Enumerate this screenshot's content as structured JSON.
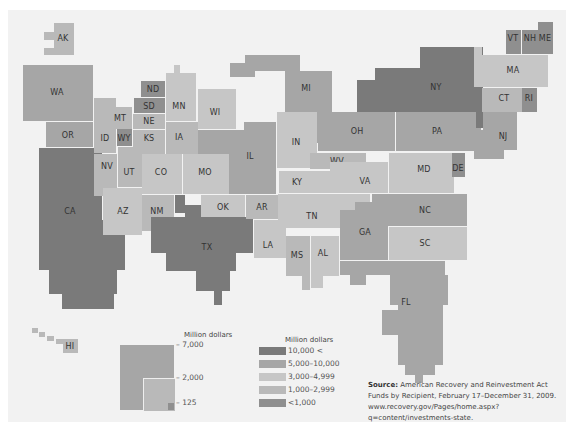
{
  "map": {
    "type": "cartogram",
    "subject": "American Recovery and Reinvestment Act funds by state recipient",
    "states": [
      {
        "code": "AK",
        "category": "1,000-2,999"
      },
      {
        "code": "HI",
        "category": "1,000-2,999"
      },
      {
        "code": "WA",
        "category": "5,000-10,000"
      },
      {
        "code": "OR",
        "category": "5,000-10,000"
      },
      {
        "code": "CA",
        "category": "10,000 <"
      },
      {
        "code": "ID",
        "category": "1,000-2,999"
      },
      {
        "code": "NV",
        "category": "1,000-2,999"
      },
      {
        "code": "MT",
        "category": "1,000-2,999"
      },
      {
        "code": "WY",
        "category": "<1,000"
      },
      {
        "code": "UT",
        "category": "1,000-2,999"
      },
      {
        "code": "AZ",
        "category": "3,000-4,999"
      },
      {
        "code": "CO",
        "category": "3,000-4,999"
      },
      {
        "code": "NM",
        "category": "1,000-2,999"
      },
      {
        "code": "ND",
        "category": "<1,000"
      },
      {
        "code": "SD",
        "category": "<1,000"
      },
      {
        "code": "NE",
        "category": "1,000-2,999"
      },
      {
        "code": "KS",
        "category": "1,000-2,999"
      },
      {
        "code": "OK",
        "category": "3,000-4,999"
      },
      {
        "code": "TX",
        "category": "10,000 <"
      },
      {
        "code": "MN",
        "category": "3,000-4,999"
      },
      {
        "code": "IA",
        "category": "1,000-2,999"
      },
      {
        "code": "MO",
        "category": "3,000-4,999"
      },
      {
        "code": "AR",
        "category": "1,000-2,999"
      },
      {
        "code": "LA",
        "category": "3,000-4,999"
      },
      {
        "code": "WI",
        "category": "3,000-4,999"
      },
      {
        "code": "IL",
        "category": "5,000-10,000"
      },
      {
        "code": "MI",
        "category": "5,000-10,000"
      },
      {
        "code": "IN",
        "category": "3,000-4,999"
      },
      {
        "code": "OH",
        "category": "5,000-10,000"
      },
      {
        "code": "KY",
        "category": "3,000-4,999"
      },
      {
        "code": "TN",
        "category": "3,000-4,999"
      },
      {
        "code": "MS",
        "category": "1,000-2,999"
      },
      {
        "code": "AL",
        "category": "3,000-4,999"
      },
      {
        "code": "GA",
        "category": "5,000-10,000"
      },
      {
        "code": "FL",
        "category": "5,000-10,000"
      },
      {
        "code": "SC",
        "category": "3,000-4,999"
      },
      {
        "code": "NC",
        "category": "5,000-10,000"
      },
      {
        "code": "VA",
        "category": "3,000-4,999"
      },
      {
        "code": "WV",
        "category": "1,000-2,999"
      },
      {
        "code": "MD",
        "category": "3,000-4,999"
      },
      {
        "code": "DE",
        "category": "<1,000"
      },
      {
        "code": "PA",
        "category": "5,000-10,000"
      },
      {
        "code": "NY",
        "category": "10,000 <"
      },
      {
        "code": "NJ",
        "category": "5,000-10,000"
      },
      {
        "code": "CT",
        "category": "1,000-2,999"
      },
      {
        "code": "RI",
        "category": "<1,000"
      },
      {
        "code": "MA",
        "category": "3,000-4,999"
      },
      {
        "code": "VT",
        "category": "<1,000"
      },
      {
        "code": "NH",
        "category": "<1,000"
      },
      {
        "code": "ME",
        "category": "<1,000"
      }
    ]
  },
  "size_legend": {
    "title": "Million dollars",
    "ticks": [
      "7,000",
      "2,000",
      "125"
    ]
  },
  "color_legend": {
    "title": "Million dollars",
    "items": [
      {
        "label": "10,000 <",
        "color": "#7a7a7a"
      },
      {
        "label": "5,000–10,000",
        "color": "#a6a6a6"
      },
      {
        "label": "3,000–4,999",
        "color": "#c6c6c6"
      },
      {
        "label": "1,000–2,999",
        "color": "#b9b9b9"
      },
      {
        "label": "<1,000",
        "color": "#8f8f8f"
      }
    ]
  },
  "source": {
    "label": "Source:",
    "text": "American Recovery and Reinvestment Act Funds by Recipient, February 17–December 31, 2009. www.recovery.gov/Pages/home.aspx?q=content/investments-state."
  }
}
